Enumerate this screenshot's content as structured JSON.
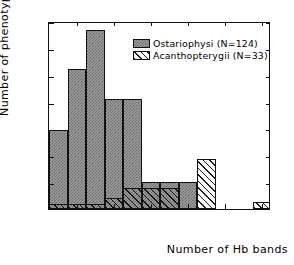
{
  "chart_data": {
    "type": "bar",
    "title": "",
    "xlabel": "Number of Hb bands",
    "ylabel": "Number of phenotypes",
    "xlim": [
      0.5,
      12.5
    ],
    "ylim": [
      0,
      35
    ],
    "xticks": [
      2,
      4,
      6,
      8,
      10,
      12
    ],
    "yticks": [
      5,
      10,
      15,
      20,
      25,
      30,
      35
    ],
    "grid": false,
    "legend_position": "top-right",
    "categories": [
      1,
      2,
      3,
      4,
      5,
      6,
      7,
      8,
      9,
      10,
      11,
      12
    ],
    "series": [
      {
        "name": "Ostariophysi (N=124)",
        "pattern": "checker",
        "values": [
          14.7,
          26.0,
          33.3,
          20.4,
          20.4,
          5.0,
          5.0,
          5.0,
          0,
          0,
          0,
          0
        ]
      },
      {
        "name": "Acanthopterygii (N=33)",
        "pattern": "hatch",
        "values": [
          1.0,
          1.0,
          1.0,
          2.0,
          4.0,
          4.0,
          4.0,
          5.0,
          9.3,
          0,
          0,
          1.3
        ]
      }
    ]
  },
  "axes": {
    "y_title": "Number of phenotypes",
    "x_title": "Number of Hb bands",
    "y_tick_labels": [
      "5",
      "10",
      "15",
      "20",
      "25",
      "30",
      "35"
    ],
    "x_tick_labels": [
      "2",
      "4",
      "6",
      "8",
      "10",
      "12"
    ]
  },
  "legend": {
    "entries": [
      {
        "label": "Ostariophysi (N=124)",
        "swatch": "checker-swatch"
      },
      {
        "label": "Acanthopterygii (N=33)",
        "swatch": "hatch-swatch"
      }
    ]
  },
  "colors": {
    "ostariophysi_fill": "#9d9d9d",
    "acanthopterygii_fill": "#ffffff",
    "outline": "#111111",
    "background": "#ffffff"
  }
}
